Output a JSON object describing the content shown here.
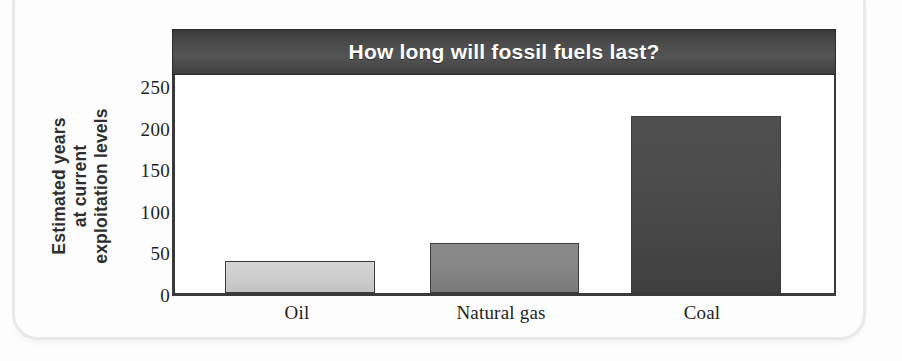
{
  "chart_data": {
    "type": "bar",
    "title": "How long will fossil fuels last?",
    "xlabel": "",
    "ylabel": "Estimated years at current exploitation levels",
    "ylabel_lines": [
      "Estimated years",
      "at current",
      "exploitation levels"
    ],
    "categories": [
      "Oil",
      "Natural gas",
      "Coal"
    ],
    "values": [
      40,
      62,
      220
    ],
    "series": [
      {
        "name": "Estimated years at current exploitation levels",
        "values": [
          40,
          62,
          220
        ]
      }
    ],
    "ylim": [
      0,
      275
    ],
    "yticks": [
      0,
      50,
      100,
      150,
      200,
      250
    ],
    "ytick_labels": [
      "0",
      "50",
      "100",
      "150",
      "200",
      "250"
    ],
    "grid": false,
    "legend": "none",
    "bar_colors": [
      "#cfcfcf",
      "#868686",
      "#4b4b4b"
    ],
    "title_bar_color": "#4a4a4a",
    "title_text_color": "#ffffff",
    "axis_color": "#3a3a3a",
    "plot_background": "#ffffff"
  }
}
